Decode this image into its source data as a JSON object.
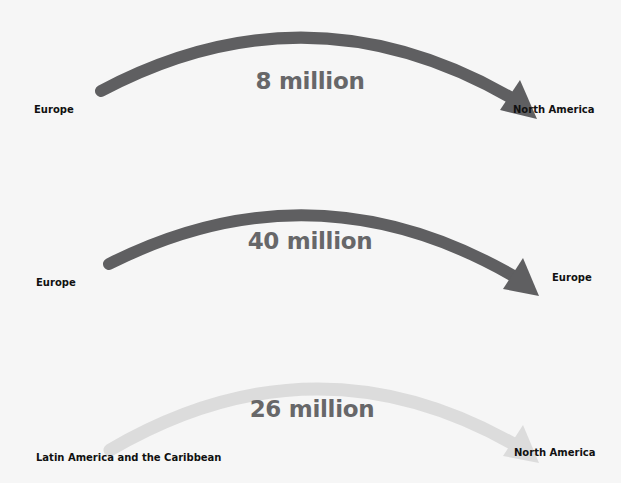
{
  "flows": [
    {
      "from": "Europe",
      "to": "North America",
      "amount": "8 million",
      "color": "#5f5f61"
    },
    {
      "from": "Europe",
      "to": "Europe",
      "amount": "40 million",
      "color": "#5f5f61"
    },
    {
      "from": "Latin America and the Caribbean",
      "to": "North America",
      "amount": "26 million",
      "color": "#dcdcdc"
    }
  ]
}
